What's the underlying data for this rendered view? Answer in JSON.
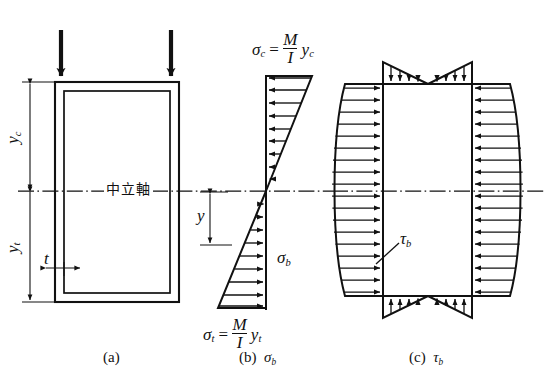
{
  "figure": {
    "background": "#ffffff",
    "ink": "#111111"
  },
  "panel_a": {
    "caption": "(a)",
    "neutral_axis_label": "中立軸",
    "dim_yc": "y",
    "dim_yc_sub": "c",
    "dim_yt": "y",
    "dim_yt_sub": "t",
    "thickness_label": "t",
    "load_arrow_count": 2
  },
  "panel_b": {
    "caption_index": "(b)",
    "caption_symbol": "σ",
    "caption_symbol_sub": "b",
    "sigma_c_sym": "σ",
    "sigma_c_sub": "c",
    "sigma_c_eq": "=",
    "sigma_c_num": "M",
    "sigma_c_den": "I",
    "sigma_c_tail": "y",
    "sigma_c_tail_sub": "c",
    "sigma_t_sym": "σ",
    "sigma_t_sub": "t",
    "sigma_t_eq": "=",
    "sigma_t_num": "M",
    "sigma_t_den": "I",
    "sigma_t_tail": "y",
    "sigma_t_tail_sub": "t",
    "sigma_b_sym": "σ",
    "sigma_b_sub": "b",
    "dim_y": "y",
    "arrow_rows_top": 9,
    "arrow_rows_bottom": 9
  },
  "panel_c": {
    "caption_index": "(c)",
    "caption_symbol": "τ",
    "caption_symbol_sub": "b",
    "tau_b_sym": "τ",
    "tau_b_sub": "b",
    "web_rows": 18,
    "flange_rows": 4
  }
}
